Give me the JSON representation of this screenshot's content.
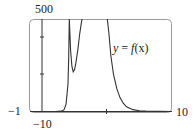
{
  "chart_data": {
    "type": "line",
    "title": "",
    "xlabel": "",
    "ylabel": "",
    "xlim": [
      -10,
      10
    ],
    "ylim": [
      -1,
      500
    ],
    "grid": false,
    "legend": null,
    "tick_labels": {
      "x_min": "-10",
      "x_max": "10",
      "y_min": "-1",
      "y_max": "500"
    },
    "annotations": [
      {
        "text": "y = f(x)",
        "x": 3.5,
        "y": 360
      }
    ],
    "series": [
      {
        "name": "y = f(x)",
        "x": [
          -10,
          -8,
          -7,
          -6.6,
          -6.3,
          -6.0,
          -5.9,
          -5.8,
          -5.6,
          -5.4,
          -5.2,
          -5.0,
          -4.8,
          -4.5,
          -4.2,
          -3.9,
          -3.8
        ],
        "y": [
          0,
          0,
          2,
          10,
          40,
          150,
          280,
          500,
          330,
          245,
          214,
          225,
          260,
          330,
          420,
          490,
          500
        ]
      },
      {
        "name": "y = f(x) (right branch)",
        "x": [
          0.05,
          0.3,
          0.6,
          1.0,
          1.5,
          2.0,
          2.5,
          3.0,
          4.0,
          5.0,
          6.0,
          8.0,
          10.0
        ],
        "y": [
          500,
          420,
          300,
          200,
          125,
          75,
          45,
          25,
          10,
          4,
          2,
          0.5,
          0
        ]
      }
    ],
    "features": {
      "local_minimum": {
        "x": -5.2,
        "y": 214
      },
      "vertical_asymptote_x": 0,
      "x_tick": 0
    }
  },
  "labels": {
    "y_max": "500",
    "y_min": "−1",
    "x_min": "−10",
    "x_max": "10",
    "curve_y": "y",
    "curve_eq": " = ",
    "curve_f": "f",
    "curve_x": "(x)"
  }
}
